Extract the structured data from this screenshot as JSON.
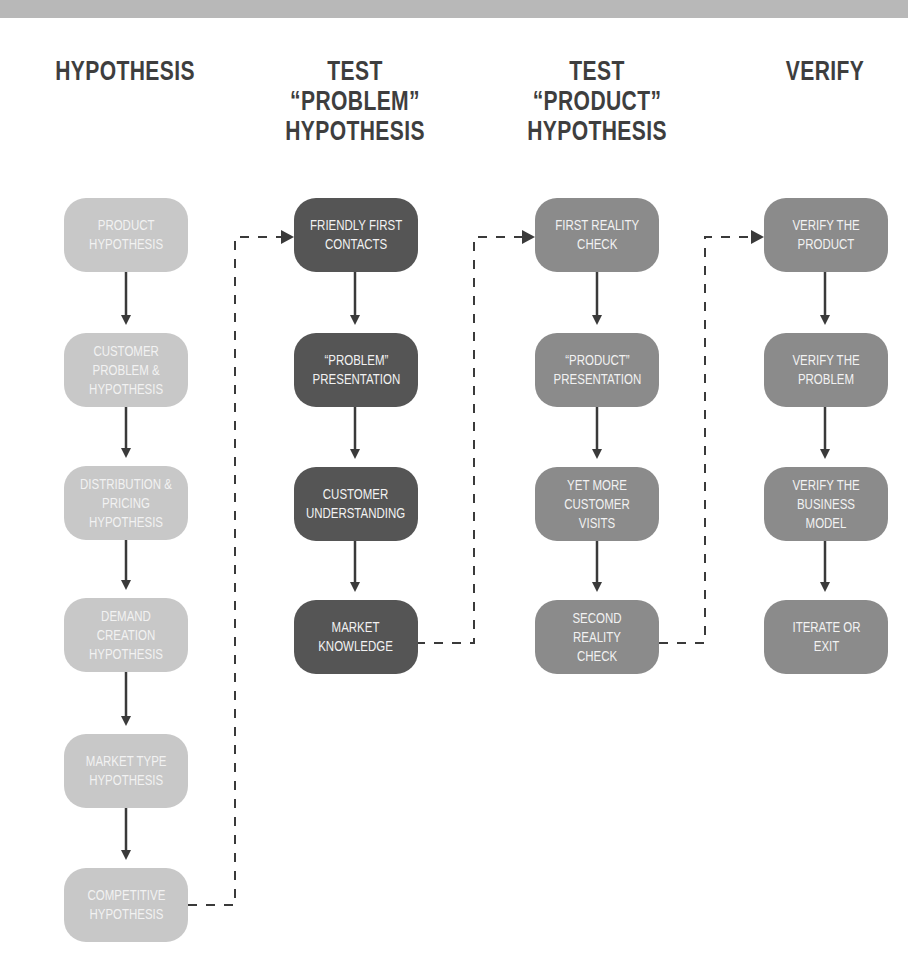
{
  "diagram": {
    "type": "flowchart",
    "colors": {
      "banner": "#b8b8b8",
      "hypothesis_boxes": "#c8c8c8",
      "test_problem_boxes": "#555555",
      "test_product_boxes": "#8b8b8b",
      "verify_boxes": "#8b8b8b",
      "arrows": "#3a3a3a",
      "header_text": "#3e3e3e",
      "box_text": "#f2f2f2"
    },
    "columns": [
      {
        "header": "HYPOTHESIS",
        "steps": [
          "PRODUCT\nHYPOTHESIS",
          "CUSTOMER\nPROBLEM &\nHYPOTHESIS",
          "DISTRIBUTION &\nPRICING\nHYPOTHESIS",
          "DEMAND CREATION\nHYPOTHESIS",
          "MARKET TYPE\nHYPOTHESIS",
          "COMPETITIVE\nHYPOTHESIS"
        ]
      },
      {
        "header": "TEST\n“PROBLEM”\nHYPOTHESIS",
        "steps": [
          "FRIENDLY FIRST\nCONTACTS",
          "“PROBLEM”\nPRESENTATION",
          "CUSTOMER\nUNDERSTANDING",
          "MARKET\nKNOWLEDGE"
        ]
      },
      {
        "header": "TEST\n“PRODUCT”\nHYPOTHESIS",
        "steps": [
          "FIRST REALITY\nCHECK",
          "“PRODUCT”\nPRESENTATION",
          "YET MORE\nCUSTOMER VISITS",
          "SECOND REALITY\nCHECK"
        ]
      },
      {
        "header": "VERIFY",
        "steps": [
          "VERIFY THE\nPRODUCT",
          "VERIFY THE\nPROBLEM",
          "VERIFY THE\nBUSINESS MODEL",
          "ITERATE OR\nEXIT"
        ]
      }
    ],
    "connectors": [
      {
        "from": "COMPETITIVE HYPOTHESIS",
        "to": "FRIENDLY FIRST CONTACTS",
        "style": "dashed"
      },
      {
        "from": "MARKET KNOWLEDGE",
        "to": "FIRST REALITY CHECK",
        "style": "dashed"
      },
      {
        "from": "SECOND REALITY CHECK",
        "to": "VERIFY THE PRODUCT",
        "style": "dashed"
      }
    ]
  }
}
